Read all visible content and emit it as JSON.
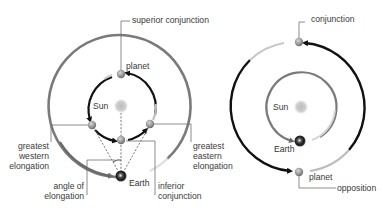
{
  "left_diagram": {
    "title_role": "inferior planet configurations",
    "labels": {
      "superior_conjunction": "superior conjunction",
      "planet": "planet",
      "sun": "Sun",
      "greatest_western_elongation": [
        "greatest",
        "western",
        "elongation"
      ],
      "greatest_eastern_elongation": [
        "greatest",
        "eastern",
        "elongation"
      ],
      "angle_of_elongation": [
        "angle of",
        "elongation"
      ],
      "earth": "Earth",
      "inferior_conjunction": [
        "inferior",
        "conjunction"
      ]
    }
  },
  "right_diagram": {
    "title_role": "superior planet configurations",
    "labels": {
      "conjunction": "conjunction",
      "sun": "Sun",
      "earth": "Earth",
      "planet": "planet",
      "opposition": "opposition"
    }
  },
  "colors": {
    "orbit_gray": "#7a7a7a",
    "arrow_black": "#111111",
    "leader_line": "#6e6e6e",
    "sun": "#c8c8c8",
    "planet": "#9a9a9a",
    "text": "#3a3a3a"
  }
}
